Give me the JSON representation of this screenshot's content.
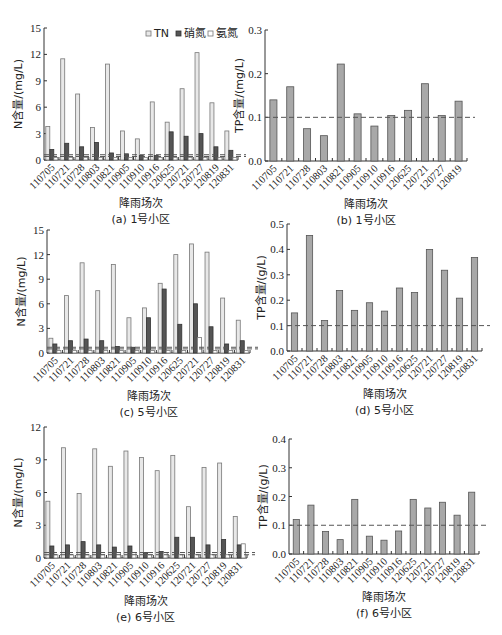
{
  "figure": {
    "panels": [
      "a",
      "b",
      "c",
      "d",
      "e",
      "f"
    ]
  },
  "colors": {
    "tn_fill": "#e8e8e8",
    "tn_stroke": "#777777",
    "nitrate_fill": "#555555",
    "ammonia_fill": "#ffffff",
    "tp_fill": "#a8a8a8",
    "tp_stroke": "#555555",
    "threshold_line": "#555555"
  },
  "chart_data": [
    {
      "id": "a",
      "type": "bar",
      "caption": "(a) 1号小区",
      "xlabel": "降雨场次",
      "ylabel": "N含量/(mg/L)",
      "ylim": [
        0,
        15
      ],
      "yticks": [
        0,
        3,
        6,
        9,
        12,
        15
      ],
      "categories": [
        "110705",
        "110721",
        "110728",
        "110803",
        "110821",
        "110905",
        "110910",
        "110916",
        "120625",
        "120721",
        "120727",
        "120819",
        "120831"
      ],
      "legend": [
        "TN",
        "硝氮",
        "氨氮"
      ],
      "legend_position": "top-right",
      "series": [
        {
          "name": "TN",
          "values": [
            3.8,
            11.5,
            7.5,
            3.7,
            10.9,
            3.3,
            2.4,
            6.6,
            4.3,
            8.1,
            12.2,
            6.5,
            3.3
          ]
        },
        {
          "name": "硝氮",
          "values": [
            1.2,
            1.9,
            1.5,
            2.0,
            0.8,
            0.7,
            0.5,
            0.5,
            3.2,
            2.7,
            3.0,
            1.5,
            1.1
          ]
        },
        {
          "name": "氨氮",
          "values": [
            0.3,
            0.3,
            0.3,
            0.3,
            0.3,
            0.3,
            0.3,
            0.3,
            0.3,
            0.3,
            0.3,
            0.3,
            0.3
          ]
        }
      ],
      "reference_lines": [
        0.6,
        0.4
      ],
      "grid": false
    },
    {
      "id": "b",
      "type": "bar",
      "caption": "(b) 1号小区",
      "xlabel": "降雨场次",
      "ylabel": "TP含量/(mg/L)",
      "ylim": [
        0,
        0.3
      ],
      "yticks": [
        "0.0",
        "0.1",
        "0.2",
        "0.3"
      ],
      "categories": [
        "110705",
        "110721",
        "110728",
        "110803",
        "110821",
        "110905",
        "110910",
        "110916",
        "120625",
        "120721",
        "120727",
        "120819"
      ],
      "series": [
        {
          "name": "TP",
          "values": [
            0.14,
            0.17,
            0.074,
            0.058,
            0.222,
            0.108,
            0.08,
            0.104,
            0.116,
            0.177,
            0.104,
            0.137
          ]
        }
      ],
      "reference_lines": [
        0.1
      ],
      "grid": false
    },
    {
      "id": "c",
      "type": "bar",
      "caption": "(c) 5号小区",
      "xlabel": "降雨场次",
      "ylabel": "N含量/(mg/L)",
      "ylim": [
        0,
        15
      ],
      "yticks": [
        0,
        3,
        6,
        9,
        12,
        15
      ],
      "categories": [
        "110705",
        "110721",
        "110728",
        "110803",
        "110821",
        "110905",
        "110910",
        "110916",
        "120625",
        "120721",
        "120727",
        "120819",
        "120831"
      ],
      "legend": [
        "TN",
        "硝氮",
        "氨氮"
      ],
      "series": [
        {
          "name": "TN",
          "values": [
            1.8,
            7.0,
            11.0,
            7.6,
            10.8,
            4.3,
            5.5,
            8.5,
            12.0,
            13.3,
            12.3,
            6.7,
            4.0
          ]
        },
        {
          "name": "硝氮",
          "values": [
            1.1,
            1.5,
            1.7,
            1.5,
            0.8,
            0.7,
            4.3,
            7.8,
            3.5,
            6.0,
            3.2,
            1.1,
            1.5
          ]
        },
        {
          "name": "氨氮",
          "values": [
            0.3,
            0.3,
            0.3,
            0.3,
            0.3,
            0.3,
            0.3,
            0.3,
            0.3,
            1.9,
            0.3,
            0.3,
            0.3
          ]
        }
      ],
      "reference_lines": [
        0.7,
        0.5
      ],
      "grid": false
    },
    {
      "id": "d",
      "type": "bar",
      "caption": "(d) 5号小区",
      "xlabel": "降雨场次",
      "ylabel": "TP含量/(g/L)",
      "ylim": [
        0,
        0.5
      ],
      "yticks": [
        "0.0",
        "0.1",
        "0.2",
        "0.3",
        "0.4",
        "0.5"
      ],
      "categories": [
        "110705",
        "110721",
        "110728",
        "110803",
        "110821",
        "110905",
        "110910",
        "110916",
        "120625",
        "120721",
        "120727",
        "120819",
        "120831"
      ],
      "series": [
        {
          "name": "TP",
          "values": [
            0.15,
            0.455,
            0.12,
            0.238,
            0.16,
            0.19,
            0.157,
            0.248,
            0.23,
            0.4,
            0.318,
            0.208,
            0.368
          ]
        }
      ],
      "reference_lines": [
        0.1
      ],
      "grid": false
    },
    {
      "id": "e",
      "type": "bar",
      "caption": "(e) 6号小区",
      "xlabel": "降雨场次",
      "ylabel": "N含量/(mg/L)",
      "ylim": [
        0,
        12
      ],
      "yticks": [
        0,
        3,
        6,
        9,
        12
      ],
      "categories": [
        "110705",
        "110721",
        "110728",
        "110803",
        "110821",
        "110905",
        "110910",
        "110916",
        "120625",
        "120721",
        "120727",
        "120819",
        "120831"
      ],
      "legend": [
        "TN",
        "硝氮",
        "氨氮"
      ],
      "series": [
        {
          "name": "TN",
          "values": [
            5.2,
            10.1,
            5.9,
            10.0,
            8.4,
            9.8,
            9.2,
            8.0,
            9.4,
            4.7,
            8.3,
            8.7,
            3.8
          ]
        },
        {
          "name": "硝氮",
          "values": [
            1.1,
            1.2,
            1.5,
            1.2,
            1.0,
            1.1,
            0.5,
            0.6,
            1.9,
            1.9,
            1.2,
            1.7,
            1.2
          ]
        },
        {
          "name": "氨氮",
          "values": [
            0.3,
            0.3,
            0.3,
            0.3,
            0.5,
            0.5,
            0.3,
            0.5,
            0.3,
            0.3,
            0.3,
            0.3,
            1.3
          ]
        }
      ],
      "reference_lines": [
        0.5,
        0.3
      ],
      "grid": false
    },
    {
      "id": "f",
      "type": "bar",
      "caption": "(f) 6号小区",
      "xlabel": "降雨场次",
      "ylabel": "TP含量/(g/L)",
      "ylim": [
        0,
        0.4
      ],
      "yticks": [
        "0.0",
        "0.1",
        "0.2",
        "0.3",
        "0.4"
      ],
      "categories": [
        "110705",
        "110721",
        "110728",
        "110803",
        "110821",
        "110905",
        "110910",
        "110916",
        "120625",
        "120721",
        "120727",
        "120819",
        "120831"
      ],
      "series": [
        {
          "name": "TP",
          "values": [
            0.12,
            0.17,
            0.078,
            0.05,
            0.19,
            0.062,
            0.048,
            0.08,
            0.19,
            0.16,
            0.18,
            0.135,
            0.215
          ]
        }
      ],
      "reference_lines": [
        0.1
      ],
      "grid": false
    }
  ]
}
